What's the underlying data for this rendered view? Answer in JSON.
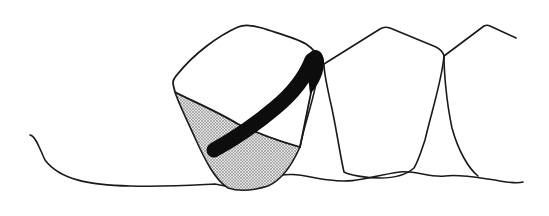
{
  "figure": {
    "type": "dental-illustration",
    "colors": {
      "background": "#ffffff",
      "stroke": "#1a1a1a",
      "band": "#0d0d0d",
      "stipple": "#9a9a9a"
    },
    "elements": [
      {
        "name": "gum-line"
      },
      {
        "name": "tooth-1-crown"
      },
      {
        "name": "tooth-1-shaded-region"
      },
      {
        "name": "black-band"
      },
      {
        "name": "tooth-2"
      },
      {
        "name": "tooth-3"
      }
    ]
  }
}
